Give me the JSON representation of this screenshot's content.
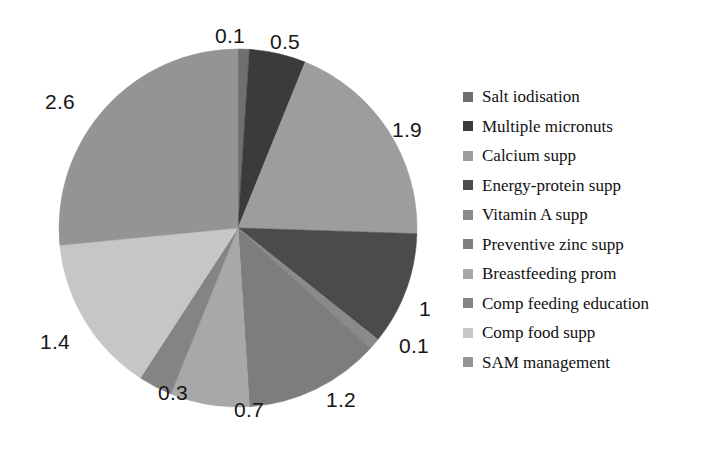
{
  "chart_data": {
    "type": "pie",
    "title": "",
    "subtitle": "",
    "xlabel": "",
    "ylabel": "",
    "legend_position": "right",
    "grid": false,
    "total": 9.8,
    "start_angle_deg": 0,
    "direction": "clockwise",
    "categories": [
      "Salt iodisation",
      "Multiple micronuts",
      "Calcium supp",
      "Energy-protein supp",
      "Vitamin A supp",
      "Preventive zinc supp",
      "Breastfeeding prom",
      "Comp feeding education",
      "Comp food supp",
      "SAM management"
    ],
    "values": [
      0.1,
      0.5,
      1.9,
      1,
      0.1,
      1.2,
      0.7,
      0.3,
      1.4,
      2.6
    ],
    "value_labels": [
      "0.1",
      "0.5",
      "1.9",
      "1",
      "0.1",
      "1.2",
      "0.7",
      "0.3",
      "1.4",
      "2.6"
    ],
    "colors": [
      "#6f6f6f",
      "#3b3b3b",
      "#9d9d9d",
      "#4b4b4b",
      "#8a8a8a",
      "#7d7d7d",
      "#a8a8a8",
      "#848484",
      "#c6c6c6",
      "#949494"
    ],
    "slices": [
      {
        "label": "Salt iodisation",
        "value": 0.1,
        "value_label": "0.1",
        "color": "#6f6f6f"
      },
      {
        "label": "Multiple micronuts",
        "value": 0.5,
        "value_label": "0.5",
        "color": "#3b3b3b"
      },
      {
        "label": "Calcium supp",
        "value": 1.9,
        "value_label": "1.9",
        "color": "#9d9d9d"
      },
      {
        "label": "Energy-protein supp",
        "value": 1,
        "value_label": "1",
        "color": "#4b4b4b"
      },
      {
        "label": "Vitamin A supp",
        "value": 0.1,
        "value_label": "0.1",
        "color": "#8a8a8a"
      },
      {
        "label": "Preventive zinc supp",
        "value": 1.2,
        "value_label": "1.2",
        "color": "#7d7d7d"
      },
      {
        "label": "Breastfeeding prom",
        "value": 0.7,
        "value_label": "0.7",
        "color": "#a8a8a8"
      },
      {
        "label": "Comp feeding education",
        "value": 0.3,
        "value_label": "0.3",
        "color": "#848484"
      },
      {
        "label": "Comp food supp",
        "value": 1.4,
        "value_label": "1.4",
        "color": "#c6c6c6"
      },
      {
        "label": "SAM management",
        "value": 2.6,
        "value_label": "2.6",
        "color": "#949494"
      }
    ]
  },
  "legend": {
    "items": [
      {
        "label": "Salt iodisation",
        "color": "#6f6f6f"
      },
      {
        "label": "Multiple micronuts",
        "color": "#3b3b3b"
      },
      {
        "label": "Calcium supp",
        "color": "#9d9d9d"
      },
      {
        "label": "Energy-protein supp",
        "color": "#4b4b4b"
      },
      {
        "label": "Vitamin A supp",
        "color": "#8a8a8a"
      },
      {
        "label": "Preventive zinc supp",
        "color": "#7d7d7d"
      },
      {
        "label": "Breastfeeding prom",
        "color": "#a8a8a8"
      },
      {
        "label": "Comp feeding education",
        "color": "#848484"
      },
      {
        "label": "Comp food supp",
        "color": "#c6c6c6"
      },
      {
        "label": "SAM management",
        "color": "#949494"
      }
    ]
  },
  "value_label_positions": [
    {
      "text": "0.1",
      "left": 215,
      "top": 24
    },
    {
      "text": "0.5",
      "left": 270,
      "top": 30
    },
    {
      "text": "1.9",
      "left": 392,
      "top": 118
    },
    {
      "text": "1",
      "left": 419,
      "top": 297
    },
    {
      "text": "0.1",
      "left": 399,
      "top": 334
    },
    {
      "text": "1.2",
      "left": 326,
      "top": 388
    },
    {
      "text": "0.7",
      "left": 234,
      "top": 398
    },
    {
      "text": "0.3",
      "left": 158,
      "top": 381
    },
    {
      "text": "1.4",
      "left": 40,
      "top": 330
    },
    {
      "text": "2.6",
      "left": 45,
      "top": 90
    }
  ]
}
